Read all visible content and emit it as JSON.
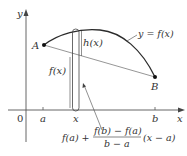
{
  "diagram": {
    "type": "mean-value-theorem-proof-figure",
    "axes": {
      "x_label": "x",
      "y_label": "y",
      "origin_label": "0",
      "x_ticks": [
        "a",
        "x",
        "b"
      ]
    },
    "points": {
      "A": "A",
      "B": "B"
    },
    "curve_label": "y = f(x)",
    "height_label": "h(x)",
    "fx_label": "f(x)",
    "secant_formula": {
      "lead": "f(a) +",
      "numerator": "f(b) − f(a)",
      "denominator": "b − a",
      "tail": "(x − a)"
    },
    "colors": {
      "curve": "#2b2b2b",
      "secant": "#8a8a8a",
      "axis": "#555555",
      "strip": "#444444",
      "text": "#333333"
    }
  }
}
